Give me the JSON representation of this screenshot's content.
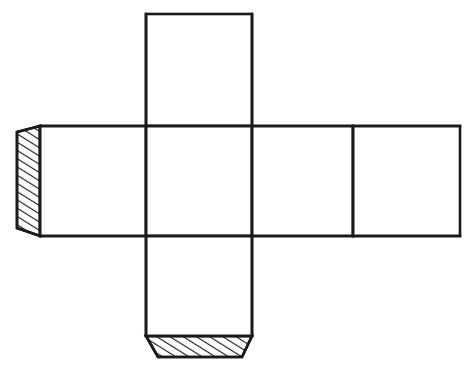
{
  "diagram": {
    "type": "line-drawing",
    "background_color": "#ffffff",
    "line_color": "#1a1a1a",
    "fill_color": "#ffffff",
    "stroke_width": 2.6,
    "canvas": {
      "width": 474,
      "height": 375
    },
    "geometry": {
      "square_size": 106,
      "grid_origin_x": 146,
      "grid_origin_y": 14,
      "columns_x": [
        40,
        146,
        252,
        353,
        460
      ],
      "rows_y": [
        14,
        126,
        236,
        336
      ]
    },
    "faces": [
      {
        "id": "face-top",
        "label": "top face",
        "x": 146,
        "y": 14,
        "width": 106,
        "height": 112
      },
      {
        "id": "face-left",
        "label": "left face",
        "x": 40,
        "y": 126,
        "width": 106,
        "height": 110
      },
      {
        "id": "face-front",
        "label": "front face",
        "x": 146,
        "y": 126,
        "width": 106,
        "height": 110
      },
      {
        "id": "face-right",
        "label": "right face",
        "x": 252,
        "y": 126,
        "width": 101,
        "height": 110
      },
      {
        "id": "face-back",
        "label": "back face",
        "x": 353,
        "y": 126,
        "width": 107,
        "height": 110
      },
      {
        "id": "face-bottom",
        "label": "bottom face",
        "x": 146,
        "y": 236,
        "width": 106,
        "height": 100
      }
    ],
    "tabs": [
      {
        "id": "tab-left",
        "label": "left glue tab",
        "shape": "trapezoid",
        "hatched": true,
        "hatch_direction": "forward-slash",
        "hatch_spacing": 7,
        "points": "40,126 17,132 17,228 40,236"
      },
      {
        "id": "tab-bottom",
        "label": "bottom glue tab",
        "shape": "trapezoid",
        "hatched": true,
        "hatch_direction": "forward-slash",
        "hatch_spacing": 7,
        "points": "146,336 252,336 242,357 158,357"
      }
    ],
    "fold_lines": [
      {
        "id": "fold-vertical-left",
        "x1": 146,
        "y1": 14,
        "x2": 146,
        "y2": 336
      },
      {
        "id": "fold-vertical-right",
        "x1": 252,
        "y1": 14,
        "x2": 252,
        "y2": 336
      },
      {
        "id": "fold-vertical-back",
        "x1": 353,
        "y1": 126,
        "x2": 353,
        "y2": 236
      },
      {
        "id": "fold-horizontal-top",
        "x1": 40,
        "y1": 126,
        "x2": 460,
        "y2": 126
      },
      {
        "id": "fold-horizontal-bottom",
        "x1": 40,
        "y1": 236,
        "x2": 460,
        "y2": 236
      }
    ]
  }
}
